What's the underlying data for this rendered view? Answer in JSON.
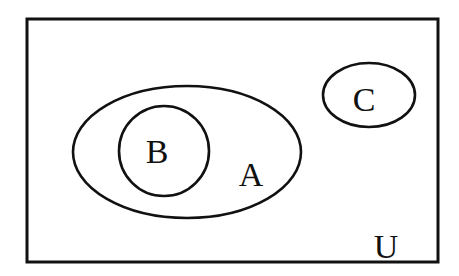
{
  "diagram": {
    "type": "venn",
    "universe": {
      "label": "U",
      "label_x": 386,
      "label_y": 258,
      "x": 27,
      "y": 19,
      "width": 411,
      "height": 243
    },
    "sets": [
      {
        "id": "A",
        "label": "A",
        "shape": "ellipse",
        "cx": 187,
        "cy": 152,
        "rx": 114,
        "ry": 66,
        "label_x": 251,
        "label_y": 186
      },
      {
        "id": "B",
        "label": "B",
        "shape": "circle",
        "cx": 164,
        "cy": 151,
        "r": 45,
        "label_x": 157,
        "label_y": 163,
        "relation": "B is a subset of A"
      },
      {
        "id": "C",
        "label": "C",
        "shape": "ellipse",
        "cx": 369,
        "cy": 95,
        "rx": 46,
        "ry": 32,
        "label_x": 364,
        "label_y": 111,
        "relation": "C is disjoint from A"
      }
    ],
    "stroke_color": "#111111",
    "background_color": "#ffffff"
  }
}
